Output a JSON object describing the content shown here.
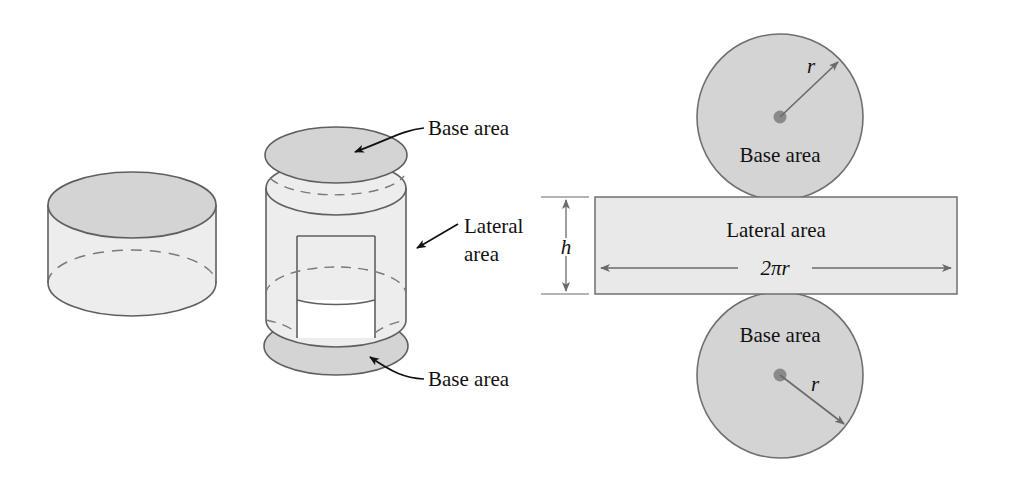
{
  "figure": {
    "colors": {
      "disc_fill": "#d4d4d4",
      "body_fill": "#ededed",
      "rect_fill": "#e9e9e9",
      "stroke": "#5f5f5f",
      "dash_stroke": "#7a7a7a",
      "leader_stroke": "#111111",
      "text": "#111111",
      "background": "#ffffff"
    }
  },
  "left_figure": {
    "name": "solid-cylinder",
    "labels": []
  },
  "middle_figure": {
    "name": "exploded-cylinder",
    "labels": {
      "top_base": "Base area",
      "lateral_line1": "Lateral",
      "lateral_line2": "area",
      "bottom_base": "Base area"
    }
  },
  "right_figure": {
    "name": "cylinder-net",
    "top_circle": {
      "label": "Base area",
      "radius_label": "r"
    },
    "rectangle": {
      "label": "Lateral area",
      "width_label": "2πr",
      "height_label": "h"
    },
    "bottom_circle": {
      "label": "Base area",
      "radius_label": "r"
    }
  }
}
